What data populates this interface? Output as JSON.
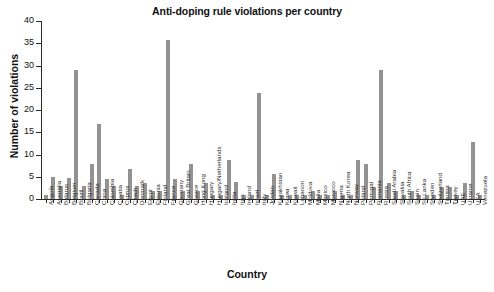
{
  "chart_data": {
    "type": "bar",
    "title": "Anti-doping rule violations per country",
    "xlabel": "Country",
    "ylabel": "Number of violations",
    "ylim": [
      0,
      40
    ],
    "yticks": [
      0,
      5,
      10,
      15,
      20,
      25,
      30,
      35,
      40
    ],
    "grid": false,
    "legend": null,
    "bar_color": "#939393",
    "axis_color": "#2a2a2a",
    "categories": [
      "Angola",
      "Australia",
      "Belarus",
      "Belgium",
      "Brazil",
      "Bulgaria",
      "Canada",
      "China",
      "Colombia",
      "Croatia",
      "Cyprus",
      "Czech",
      "Denmark",
      "Egypt",
      "Estonia",
      "Finland",
      "France",
      "Germany",
      "Great Britain",
      "Greece",
      "Hong Kong",
      "Hungary",
      "Hungary/Netherlands",
      "Iceland",
      "India",
      "Iran",
      "Ireland",
      "Israel",
      "Italy",
      "Jordan",
      "Kazakhstan",
      "Korea",
      "Kuwait",
      "Lebanon",
      "Moldova",
      "Malta",
      "Mexico",
      "Morocco",
      "Nigeria",
      "North Korea",
      "Norway",
      "Poland",
      "Portugal",
      "Romania",
      "Russia",
      "Saudi Arabia",
      "Slovakia",
      "South Africa",
      "Spain",
      "Sri Lanka",
      "Sweden",
      "Switzerland",
      "Tunisia",
      "Turkey",
      "UAE",
      "Ukraine",
      "USA",
      "Venezuela"
    ],
    "values": [
      0.9,
      4.9,
      2.9,
      4.7,
      28.9,
      2.9,
      7.8,
      16.9,
      4.6,
      2.9,
      0.8,
      6.7,
      2.9,
      3.7,
      1.8,
      1.8,
      35.8,
      4.6,
      1.9,
      7.8,
      1.8,
      3.7,
      0.8,
      0.8,
      8.7,
      3.8,
      0.9,
      0.9,
      23.8,
      0.9,
      5.7,
      0.9,
      0.9,
      0.9,
      0.9,
      1.7,
      0.9,
      0.9,
      1.8,
      0.9,
      0.9,
      8.7,
      7.8,
      2.7,
      28.9,
      3.7,
      1.8,
      0.8,
      1.7,
      0.8,
      0.8,
      0.9,
      2.7,
      2.7,
      0.8,
      3.7,
      12.8,
      0.8
    ]
  }
}
